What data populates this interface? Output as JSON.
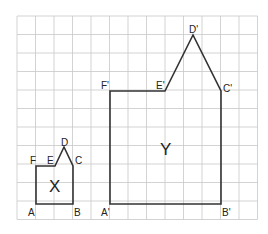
{
  "grid": {
    "x0": 17,
    "y0": 16,
    "cols": 13,
    "rows": 11,
    "cell": 18.5,
    "line_color": "#c8c8c8",
    "border_color": "#bdbdbd"
  },
  "shape_x": {
    "name": "X",
    "stroke": "#333333",
    "vertices": {
      "A": [
        0.5,
        10.35
      ],
      "B": [
        2.5,
        10.35
      ],
      "C": [
        2.5,
        8.3
      ],
      "D": [
        2.0,
        7.3
      ],
      "E": [
        1.5,
        8.3
      ],
      "F": [
        0.5,
        8.3
      ]
    },
    "labels": {
      "A": "A",
      "B": "B",
      "C": "C",
      "D": "D",
      "E": "E",
      "F": "F",
      "center": "X"
    }
  },
  "shape_y": {
    "name": "Y",
    "stroke": "#333333",
    "labels": {
      "A": "A'",
      "B": "B'",
      "C": "C'",
      "D": "D'",
      "E": "E'",
      "F": "F'",
      "center": "Y"
    }
  }
}
